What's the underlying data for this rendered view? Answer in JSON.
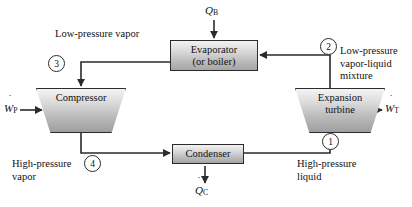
{
  "diagram": {
    "stroke_color": "#2b2b2b",
    "fill_light": "#f2f2f2",
    "fill_dark": "#a6a6a6"
  },
  "components": {
    "evaporator": {
      "line1": "Evaporator",
      "line2": "(or boiler)"
    },
    "condenser": {
      "line1": "Condenser"
    },
    "compressor": {
      "line1": "Compressor"
    },
    "turbine": {
      "line1": "Expansion",
      "line2": "turbine"
    }
  },
  "states": {
    "s1": "1",
    "s2": "2",
    "s3": "3",
    "s4": "4"
  },
  "annotations": {
    "low_pressure_vapor": "Low-pressure vapor",
    "high_pressure_vapor_l1": "High-pressure",
    "high_pressure_vapor_l2": "vapor",
    "low_pressure_mixture_l1": "Low-pressure",
    "low_pressure_mixture_l2": "vapor-liquid",
    "low_pressure_mixture_l3": "mixture",
    "high_pressure_liquid_l1": "High-pressure",
    "high_pressure_liquid_l2": "liquid"
  },
  "flows": {
    "heat_in": {
      "base": "Q",
      "dot": "˙",
      "sub": "B"
    },
    "heat_out": {
      "base": "Q",
      "dot": "˙",
      "sub": "C"
    },
    "work_in": {
      "base": "W",
      "dot": "˙",
      "sub": "P"
    },
    "work_out": {
      "base": "W",
      "dot": "˙",
      "sub": "T"
    }
  }
}
